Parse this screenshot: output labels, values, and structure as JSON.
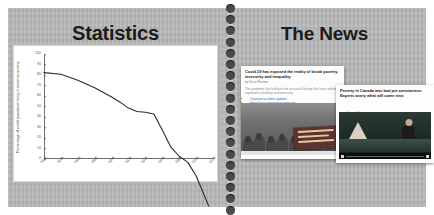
{
  "spread": {
    "binding": {
      "icon": "spiral-binding-holes",
      "hole_count": 19
    }
  },
  "left_page": {
    "title": "Statistics",
    "chart_card": {
      "ylabel": "Percentage of world population living in extreme poverty"
    }
  },
  "right_page": {
    "title": "The News",
    "articles": [
      {
        "name": "poverty-inequality-article",
        "headline": "Covid-19 has exposed the reality of brutal poverty, insecurity and inequality",
        "byline": "by Kevin Farmer",
        "body": "The pandemic has laid bare the structural failings that leave millions exposed to hardship and insecurity.",
        "links": [
          "Coronavirus latest updates",
          "See all our coronavirus coverage"
        ],
        "photo": "protest-crowd-photo",
        "photo_caption": "Demonstrators march demanding action on poverty."
      },
      {
        "name": "canada-poverty-article",
        "headline": "Poverty in Canada was bad pre-coronavirus. Experts worry what will come next",
        "kicker": "Social Sharing",
        "kicker_sub": "Posted: May 04",
        "photo": "news-anchor-video",
        "player": {
          "icon": "play-icon"
        }
      }
    ]
  },
  "chart_data": {
    "type": "line",
    "title": "",
    "xlabel": "",
    "ylabel": "Percentage of world population living in extreme poverty",
    "xlim": [
      1820,
      2020
    ],
    "ylim": [
      0,
      100
    ],
    "grid": false,
    "legend": false,
    "yticks": [
      0,
      10,
      20,
      30,
      40,
      50,
      60,
      70,
      80,
      90,
      100
    ],
    "xticks": [
      1820,
      1840,
      1860,
      1880,
      1900,
      1920,
      1940,
      1960,
      1980,
      2000,
      2020
    ],
    "series": [
      {
        "name": "Share in extreme poverty",
        "x": [
          1820,
          1840,
          1860,
          1880,
          1900,
          1910,
          1920,
          1930,
          1940,
          1950,
          1960,
          1970,
          1980,
          1990,
          2000,
          2010,
          2015
        ],
        "values": [
          89.0,
          88.0,
          84.5,
          80.0,
          74.5,
          71.5,
          68.0,
          66.0,
          65.5,
          64.5,
          55.0,
          45.0,
          39.5,
          36.0,
          28.0,
          16.0,
          10.0
        ]
      }
    ]
  }
}
